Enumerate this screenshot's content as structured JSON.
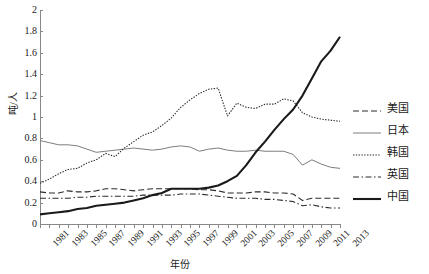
{
  "chart_data": {
    "type": "line",
    "title": "",
    "xlabel": "年份",
    "ylabel": "吨/人",
    "xlim": [
      1981,
      2013
    ],
    "ylim": [
      0,
      2
    ],
    "ytick_labels": [
      "0",
      "0.2",
      "0.4",
      "0.6",
      "0.8",
      "1",
      "1.2",
      "1.4",
      "1.6",
      "1.8",
      "2"
    ],
    "ytick_values": [
      0,
      0.2,
      0.4,
      0.6,
      0.8,
      1,
      1.2,
      1.4,
      1.6,
      1.8,
      2
    ],
    "grid": false,
    "legend_position": "right",
    "x": [
      1981,
      1982,
      1983,
      1984,
      1985,
      1986,
      1987,
      1988,
      1989,
      1990,
      1991,
      1992,
      1993,
      1994,
      1995,
      1996,
      1997,
      1998,
      1999,
      2000,
      2001,
      2002,
      2003,
      2004,
      2005,
      2006,
      2007,
      2008,
      2009,
      2010,
      2011,
      2012,
      2013
    ],
    "xtick_labels": [
      "1981",
      "1983",
      "1985",
      "1987",
      "1989",
      "1991",
      "1993",
      "1995",
      "1997",
      "1999",
      "2001",
      "2003",
      "2005",
      "2007",
      "2009",
      "2011",
      "2013"
    ],
    "series": [
      {
        "name": "美国",
        "style": "dashed",
        "color": "#2b2b2b",
        "width": 1.1,
        "values": [
          0.3,
          0.29,
          0.29,
          0.31,
          0.3,
          0.3,
          0.31,
          0.33,
          0.33,
          0.32,
          0.31,
          0.32,
          0.33,
          0.33,
          0.33,
          0.33,
          0.33,
          0.32,
          0.32,
          0.31,
          0.29,
          0.29,
          0.29,
          0.3,
          0.3,
          0.29,
          0.29,
          0.28,
          0.22,
          0.24,
          0.24,
          0.24,
          0.24
        ]
      },
      {
        "name": "日本",
        "style": "solid-thin",
        "color": "#7d7d7d",
        "width": 1.0,
        "values": [
          0.78,
          0.76,
          0.74,
          0.74,
          0.73,
          0.7,
          0.67,
          0.68,
          0.69,
          0.7,
          0.71,
          0.7,
          0.69,
          0.7,
          0.72,
          0.73,
          0.72,
          0.68,
          0.7,
          0.71,
          0.69,
          0.68,
          0.68,
          0.69,
          0.68,
          0.68,
          0.68,
          0.65,
          0.55,
          0.6,
          0.56,
          0.53,
          0.52
        ]
      },
      {
        "name": "韩国",
        "style": "dotted",
        "color": "#2b2b2b",
        "width": 1.1,
        "values": [
          0.38,
          0.42,
          0.47,
          0.51,
          0.52,
          0.57,
          0.6,
          0.66,
          0.63,
          0.71,
          0.77,
          0.83,
          0.86,
          0.92,
          0.99,
          1.09,
          1.16,
          1.22,
          1.26,
          1.27,
          1.01,
          1.13,
          1.09,
          1.08,
          1.12,
          1.12,
          1.17,
          1.15,
          1.04,
          1.0,
          0.98,
          0.97,
          0.96
        ]
      },
      {
        "name": "英国",
        "style": "dashdot",
        "color": "#2b2b2b",
        "width": 1.1,
        "values": [
          0.24,
          0.24,
          0.24,
          0.24,
          0.25,
          0.25,
          0.26,
          0.26,
          0.26,
          0.26,
          0.26,
          0.27,
          0.27,
          0.27,
          0.27,
          0.28,
          0.28,
          0.28,
          0.27,
          0.26,
          0.25,
          0.24,
          0.24,
          0.24,
          0.23,
          0.23,
          0.22,
          0.21,
          0.17,
          0.18,
          0.16,
          0.15,
          0.15
        ]
      },
      {
        "name": "中国",
        "style": "solid-thick",
        "color": "#1a1a1a",
        "width": 2.1,
        "values": [
          0.09,
          0.1,
          0.11,
          0.12,
          0.14,
          0.15,
          0.17,
          0.18,
          0.19,
          0.2,
          0.22,
          0.24,
          0.27,
          0.29,
          0.33,
          0.33,
          0.33,
          0.33,
          0.34,
          0.36,
          0.4,
          0.45,
          0.55,
          0.67,
          0.77,
          0.88,
          0.98,
          1.07,
          1.2,
          1.36,
          1.52,
          1.62,
          1.75
        ]
      }
    ]
  },
  "legend": {
    "items": [
      {
        "label": "美国"
      },
      {
        "label": "日本"
      },
      {
        "label": "韩国"
      },
      {
        "label": "英国"
      },
      {
        "label": "中国"
      }
    ]
  }
}
